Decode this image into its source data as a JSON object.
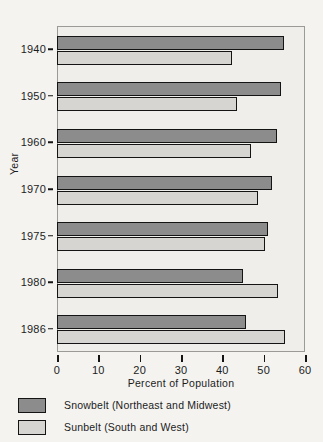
{
  "chart_data": {
    "type": "bar",
    "orientation": "horizontal",
    "title": "",
    "xlabel": "Percent of Population",
    "ylabel": "Year",
    "categories": [
      "1940",
      "1950",
      "1960",
      "1970",
      "1975",
      "1980",
      "1986"
    ],
    "xlim": [
      0,
      60
    ],
    "xticks": [
      0,
      10,
      20,
      30,
      40,
      50,
      60
    ],
    "xtick_labels": [
      "0",
      "10",
      "20",
      "30",
      "40",
      "50",
      "60"
    ],
    "grid": false,
    "legend_position": "below",
    "series": [
      {
        "name": "Snowbelt (Northeast and Midwest)",
        "color": "#8c8c8c",
        "values": [
          54.6,
          54.0,
          53.0,
          51.8,
          50.8,
          44.8,
          45.4
        ]
      },
      {
        "name": "Sunbelt (South and West)",
        "color": "#d6d5d2",
        "values": [
          42.2,
          43.2,
          46.6,
          48.4,
          50.0,
          53.2,
          54.8
        ]
      }
    ]
  },
  "axes": {
    "y_title": "Year",
    "x_title": "Percent of Population"
  },
  "legend": {
    "items": [
      {
        "label": "Snowbelt (Northeast and Midwest)",
        "swatch": "snow"
      },
      {
        "label": "Sunbelt (South and West)",
        "swatch": "sun"
      }
    ]
  },
  "colors": {
    "snowbelt": "#8c8c8c",
    "sunbelt": "#d6d5d2",
    "plot_background": "#efeeeb",
    "page_background": "#f4f3f0",
    "outline": "#141414"
  }
}
